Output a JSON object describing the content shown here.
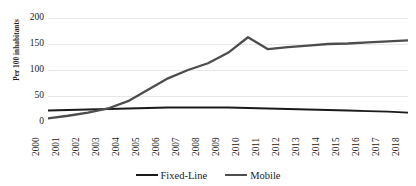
{
  "chart_data": {
    "type": "line",
    "title": "",
    "subtitle": "",
    "xlabel": "",
    "ylabel": "Per 100 inhabitants",
    "categories": [
      "2000",
      "2001",
      "2002",
      "2003",
      "2004",
      "2005",
      "2006",
      "2007",
      "2008",
      "2009",
      "2010",
      "2011",
      "2012",
      "2013",
      "2014",
      "2015",
      "2016",
      "2017",
      "2018"
    ],
    "yticks": [
      0,
      50,
      100,
      150,
      200
    ],
    "ylim": [
      0,
      200
    ],
    "grid": true,
    "grid_axis": "y",
    "legend_position": "bottom",
    "series": [
      {
        "name": "Fixed-Line",
        "color": "#1a1a1a",
        "values": [
          22,
          23,
          24,
          25,
          26,
          27,
          28,
          28,
          28,
          28,
          27,
          26,
          25,
          24,
          23,
          22,
          21,
          20,
          18
        ]
      },
      {
        "name": "Mobile",
        "color": "#4d4d4d",
        "values": [
          7,
          12,
          18,
          26,
          40,
          62,
          84,
          100,
          113,
          133,
          163,
          140,
          144,
          147,
          150,
          151,
          153,
          155,
          157
        ]
      }
    ]
  },
  "axis": {
    "y_tick_labels": [
      "200",
      "150",
      "100",
      "50",
      "0"
    ],
    "y_axis_title": "Per 100 inhabitants"
  },
  "legend": {
    "items": [
      {
        "label": "Fixed-Line",
        "color": "#1a1a1a"
      },
      {
        "label": "Mobile",
        "color": "#4d4d4d"
      }
    ]
  },
  "style": {
    "grid_color": "#e8e8e8",
    "text_color": "#1a1a1a",
    "background": "#ffffff"
  }
}
